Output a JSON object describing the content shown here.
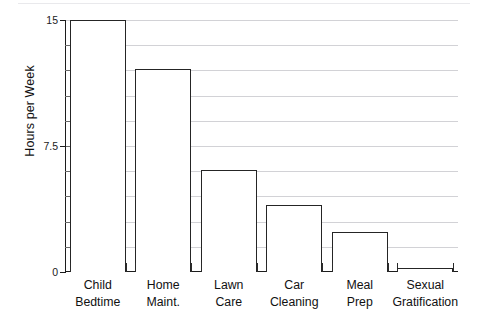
{
  "chart_data": {
    "type": "bar",
    "title": "",
    "xlabel": "",
    "ylabel": "Hours per Week",
    "categories": [
      "Child Bedtime",
      "Home Maint.",
      "Lawn Care",
      "Car Cleaning",
      "Meal Prep",
      "Sexual Gratification"
    ],
    "category_lines": [
      [
        "Child",
        "Bedtime"
      ],
      [
        "Home",
        "Maint."
      ],
      [
        "Lawn",
        "Care"
      ],
      [
        "Car",
        "Cleaning"
      ],
      [
        "Meal",
        "Prep"
      ],
      [
        "Sexual",
        "Gratification"
      ]
    ],
    "values": [
      15,
      12.1,
      6.1,
      4.0,
      2.4,
      0.25
    ],
    "ylim": [
      0,
      15
    ],
    "ytick_labels": [
      "0",
      "7.5",
      "15"
    ],
    "ytick_values": [
      0,
      7.5,
      15
    ],
    "minor_tick_values": [
      1.5,
      3,
      4.5,
      6,
      7.5,
      9,
      10.5,
      12,
      13.5
    ],
    "gridline_values": [
      1.5,
      3,
      4.5,
      6,
      7.5,
      9,
      10.5,
      12,
      13.5,
      15
    ],
    "grid": true,
    "legend": "none",
    "bar_fill_color": "#ffffff",
    "bar_edge_color": "#252525",
    "gridline_color": "#d2d2d6",
    "axis_color": "#1c1c1c"
  }
}
